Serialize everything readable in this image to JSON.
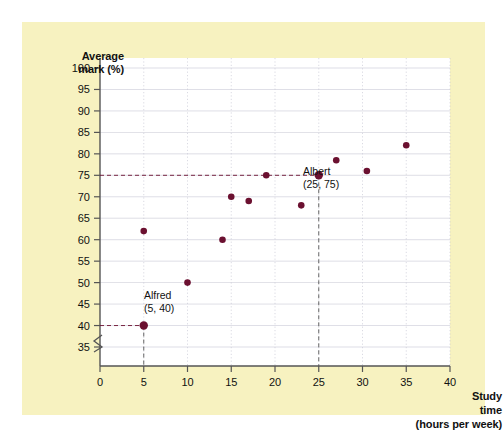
{
  "figure": {
    "background_color": "#ffffff",
    "panel_color": "#f7f2c0",
    "plot_background_color": "#ffffff",
    "point_color": "#6b1030",
    "grid_color": "#c9c9d6",
    "axis_color": "#555555"
  },
  "axes": {
    "y_title_line1": "Average",
    "y_title_line2": "mark (%)",
    "x_title_line1": "Study",
    "x_title_line2": "time",
    "x_title_line3": "(hours per week)",
    "y_ticks": [
      35,
      40,
      45,
      50,
      55,
      60,
      65,
      70,
      75,
      80,
      85,
      90,
      95,
      100
    ],
    "x_ticks": [
      0,
      5,
      10,
      15,
      20,
      25,
      30,
      35,
      40
    ],
    "y_axis_break": true,
    "ylim": [
      35,
      100
    ],
    "xlim": [
      0,
      40
    ],
    "grid": true
  },
  "annotations": [
    {
      "name": "Alfred",
      "coords": "(5, 40)",
      "x": 5,
      "y": 40,
      "label_x": 144,
      "label_y": 299
    },
    {
      "name": "Albert",
      "coords": "(25, 75)",
      "x": 25,
      "y": 75,
      "label_x": 303,
      "label_y": 175
    }
  ],
  "chart_data": {
    "type": "scatter",
    "title": "",
    "xlabel": "Study time (hours per week)",
    "ylabel": "Average mark (%)",
    "xlim": [
      0,
      40
    ],
    "ylim": [
      35,
      100
    ],
    "grid": true,
    "legend": "none",
    "x": [
      5,
      5,
      10,
      14,
      15,
      17,
      19,
      23,
      25,
      27,
      30.5,
      35
    ],
    "y": [
      40,
      62,
      50,
      60,
      70,
      69,
      75,
      68,
      75,
      78.5,
      76,
      82
    ],
    "points": [
      {
        "x": 5,
        "y": 40,
        "label": "Alfred"
      },
      {
        "x": 5,
        "y": 62,
        "label": ""
      },
      {
        "x": 10,
        "y": 50,
        "label": ""
      },
      {
        "x": 14,
        "y": 60,
        "label": ""
      },
      {
        "x": 15,
        "y": 70,
        "label": ""
      },
      {
        "x": 17,
        "y": 69,
        "label": ""
      },
      {
        "x": 19,
        "y": 75,
        "label": ""
      },
      {
        "x": 23,
        "y": 68,
        "label": ""
      },
      {
        "x": 25,
        "y": 75,
        "label": "Albert"
      },
      {
        "x": 27,
        "y": 78.5,
        "label": ""
      },
      {
        "x": 30.5,
        "y": 76,
        "label": ""
      },
      {
        "x": 35,
        "y": 82,
        "label": ""
      }
    ]
  }
}
